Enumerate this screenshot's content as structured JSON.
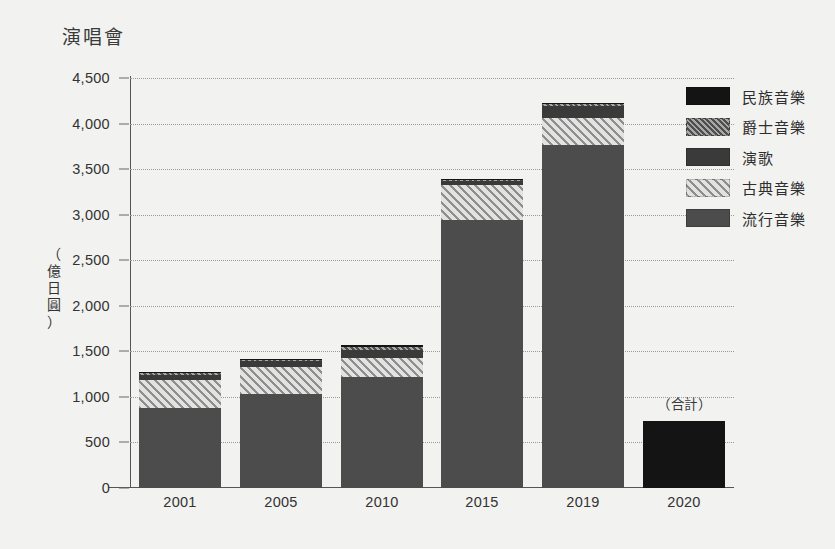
{
  "chart_data": {
    "type": "bar",
    "title": "演唱會",
    "subtitle": "",
    "xlabel": "",
    "ylabel": "（億日圓）",
    "ylabel_chars": [
      "（",
      "億",
      "日",
      "圓",
      "）"
    ],
    "ylim": [
      0,
      4500
    ],
    "ytick_step": 500,
    "ytick_labels": [
      "4,500",
      "4,000",
      "3,500",
      "3,000",
      "2,500",
      "2,000",
      "1,500",
      "1,000",
      "500",
      "0"
    ],
    "ytick_values": [
      4500,
      4000,
      3500,
      3000,
      2500,
      2000,
      1500,
      1000,
      500,
      0
    ],
    "grid": true,
    "stacked": true,
    "legend_position": "right",
    "categories": [
      "2001",
      "2005",
      "2010",
      "2015",
      "2019",
      "2020"
    ],
    "series": [
      {
        "name": "流行音樂",
        "key": "pop",
        "style": "solid-gray",
        "color": "#4c4c4c",
        "values": [
          880,
          1030,
          1220,
          2940,
          3765,
          null
        ]
      },
      {
        "name": "古典音樂",
        "key": "classic",
        "style": "light-hatch",
        "color": "#8e8e8e",
        "values": [
          310,
          300,
          205,
          390,
          295,
          null
        ]
      },
      {
        "name": "演歌",
        "key": "enka",
        "style": "solid-dark",
        "color": "#3a3a3a",
        "values": [
          55,
          65,
          95,
          40,
          130,
          null
        ]
      },
      {
        "name": "爵士音樂",
        "key": "jazz",
        "style": "dense-hatch",
        "color": "#4e4e4e",
        "values": [
          15,
          10,
          25,
          10,
          20,
          null
        ]
      },
      {
        "name": "民族音樂",
        "key": "folk",
        "style": "solid-black",
        "color": "#141414",
        "values": [
          10,
          10,
          25,
          10,
          15,
          null
        ]
      }
    ],
    "totals": [
      1270,
      1415,
      1570,
      3390,
      4225,
      735
    ],
    "special_bars": [
      {
        "category": "2020",
        "label": "（合計）",
        "style": "solid-black",
        "color": "#141414",
        "value": 735
      }
    ],
    "annotations": [
      {
        "text": "（合計）",
        "near_category": "2020"
      }
    ]
  },
  "legend": {
    "items": [
      {
        "label": "民族音樂",
        "swatch": "solid-black"
      },
      {
        "label": "爵士音樂",
        "swatch": "dense-hatch"
      },
      {
        "label": "演歌",
        "swatch": "solid-dark"
      },
      {
        "label": "古典音樂",
        "swatch": "light-hatch"
      },
      {
        "label": "流行音樂",
        "swatch": "solid-gray"
      }
    ]
  }
}
